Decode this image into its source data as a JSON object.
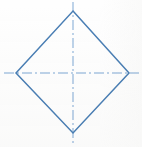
{
  "figure": {
    "canvas": {
      "width": 142,
      "height": 147,
      "background": "#fefefe"
    },
    "shape": {
      "name": "diamond",
      "type": "rhombus",
      "stroke_color": "#4a7fb5",
      "stroke_width": 1.5,
      "fill": "none",
      "vertices": {
        "top": {
          "x": 73,
          "y": 11
        },
        "right": {
          "x": 129,
          "y": 73
        },
        "bottom": {
          "x": 73,
          "y": 133
        },
        "left": {
          "x": 16,
          "y": 73
        }
      },
      "points_path": "73,11 129,73 73,133 16,73",
      "width_px": 113,
      "height_px": 122
    },
    "centerlines": {
      "style": "dash-dot",
      "stroke_color": "#7fa8d4",
      "stroke_width": 1,
      "dash_pattern": "10 3 2 3",
      "horizontal": {
        "x1": 4,
        "y1": 73,
        "x2": 139,
        "y2": 73,
        "label": "horizontal-centerline"
      },
      "vertical": {
        "x1": 73,
        "y1": 2,
        "x2": 73,
        "y2": 145,
        "label": "vertical-centerline"
      },
      "intersection": {
        "x": 73,
        "y": 73
      }
    }
  }
}
